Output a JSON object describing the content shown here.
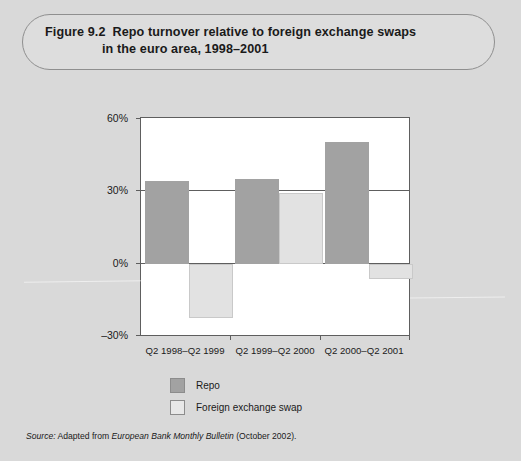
{
  "figure": {
    "number": "Figure 9.2",
    "title_line1": "Repo turnover relative to foreign exchange swaps",
    "title_line2": "in the euro area, 1998–2001"
  },
  "source": {
    "label": "Source:",
    "prefix": " Adapted from ",
    "publication": "European Bank Monthly Bulletin",
    "suffix": " (October 2002)."
  },
  "legend": {
    "items": [
      {
        "label": "Repo",
        "color": "#a2a2a2"
      },
      {
        "label": "Foreign exchange swap",
        "color": "#e8e8e8"
      }
    ]
  },
  "axis": {
    "y_ticks": [
      "60%",
      "30%",
      "0%",
      "‒30%"
    ]
  },
  "chart_data": {
    "type": "bar",
    "title": "Repo turnover relative to foreign exchange swaps in the euro area, 1998–2001",
    "xlabel": "",
    "ylabel": "",
    "categories": [
      "Q2 1998–Q2 1999",
      "Q2 1999–Q2 2000",
      "Q2 2000–Q2 2001"
    ],
    "series": [
      {
        "name": "Repo",
        "color": "#a2a2a2",
        "values": [
          34,
          35,
          50
        ]
      },
      {
        "name": "Foreign exchange swap",
        "color": "#e2e2e2",
        "values": [
          -22,
          29,
          -6
        ]
      }
    ],
    "ylim": [
      -30,
      60
    ],
    "ytick_values": [
      60,
      30,
      0,
      -30
    ],
    "ytick_labels": [
      "60%",
      "30%",
      "0%",
      "‒30%"
    ],
    "grid": true,
    "gridlines_at": [
      30,
      0
    ],
    "legend_position": "bottom-left"
  }
}
